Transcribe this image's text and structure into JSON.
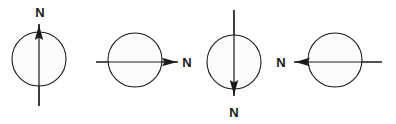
{
  "figure": {
    "background_color": "#ffffff",
    "stroke_color": "#1a1a1a",
    "circle_fill_color": "#fbfbfb",
    "width": 396,
    "height": 124,
    "panel_count": 4,
    "panels": [
      {
        "id": "panel-1",
        "label": "N",
        "label_x": 40,
        "label_y": 12,
        "direction": "up",
        "circle": {
          "cx": 39,
          "cy": 59,
          "r": 27
        },
        "axis": {
          "x1": 39,
          "y1": 24,
          "x2": 39,
          "y2": 106
        },
        "arrow_tip": {
          "x": 39,
          "y": 25
        }
      },
      {
        "id": "panel-2",
        "label": "N",
        "label_x": 187,
        "label_y": 67,
        "direction": "right",
        "circle": {
          "cx": 135,
          "cy": 60,
          "r": 27
        },
        "axis": {
          "x1": 96,
          "y1": 62,
          "x2": 178,
          "y2": 62
        },
        "arrow_tip": {
          "x": 177,
          "y": 62
        }
      },
      {
        "id": "panel-3",
        "label": "N",
        "label_x": 234,
        "label_y": 113,
        "direction": "down",
        "circle": {
          "cx": 234,
          "cy": 62,
          "r": 27
        },
        "axis": {
          "x1": 234,
          "y1": 10,
          "x2": 234,
          "y2": 96
        },
        "arrow_tip": {
          "x": 234,
          "y": 95
        }
      },
      {
        "id": "panel-4",
        "label": "N",
        "label_x": 281,
        "label_y": 67,
        "direction": "left",
        "circle": {
          "cx": 335,
          "cy": 60,
          "r": 27
        },
        "axis": {
          "x1": 294,
          "y1": 62,
          "x2": 382,
          "y2": 62
        },
        "arrow_tip": {
          "x": 295,
          "y": 62
        }
      }
    ]
  }
}
